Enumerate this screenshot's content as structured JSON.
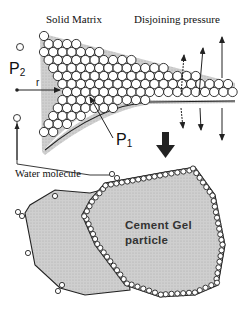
{
  "diagram": {
    "labels": {
      "solid_matrix": "Solid Matrix",
      "disjoining_pressure": "Disjoining pressure",
      "p2": "P",
      "p2_sub": "2",
      "r": "r",
      "p1": "P",
      "p1_sub": "1",
      "water_molecule": "Water molecule",
      "cement_gel_line1": "Cement Gel",
      "cement_gel_line2": "particle"
    },
    "colors": {
      "fill_gray": "#c8c8c8",
      "stroke": "#222222",
      "molecule_fill": "#ffffff"
    }
  }
}
